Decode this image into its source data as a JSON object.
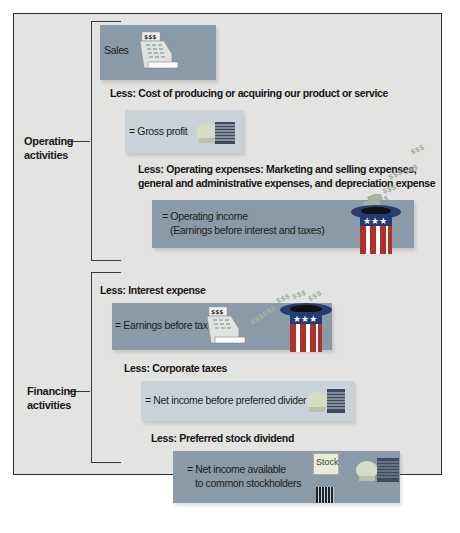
{
  "diagram": {
    "groups": {
      "operating": {
        "label_line1": "Operating",
        "label_line2": "activities"
      },
      "financing": {
        "label_line1": "Financing",
        "label_line2": "activities"
      }
    },
    "steps": {
      "sales": {
        "label": "Sales"
      },
      "less_cogs": {
        "label": "Less: Cost of producing or acquiring our product or service"
      },
      "gross_profit": {
        "label": "= Gross profit"
      },
      "less_opex": {
        "line1": "Less: Operating expenses: Marketing and selling expenses,",
        "line2": "general and administrative expenses, and depreciation expense"
      },
      "operating_income": {
        "line1": "= Operating income",
        "line2": "(Earnings before interest and taxes)"
      },
      "less_interest": {
        "label": "Less: Interest expense"
      },
      "ebt": {
        "label": "= Earnings before taxes"
      },
      "less_taxes": {
        "label": "Less: Corporate taxes"
      },
      "net_income_before_pref": {
        "label": "= Net income before preferred dividends"
      },
      "less_pref": {
        "label": "Less: Preferred stock dividend"
      },
      "net_income_common": {
        "line1": "= Net income available",
        "line2": "to common stockholders"
      }
    },
    "icons": {
      "cash_register_label": "$ $ $",
      "stock_label": "Stock",
      "money_label": "$$$"
    },
    "colors": {
      "frame_bg": "#e3e3e2",
      "dark_box": "#8a9aa6",
      "light_box": "#c9d2d8",
      "hat_red": "#b0302c",
      "hat_blue": "#233a78"
    }
  }
}
